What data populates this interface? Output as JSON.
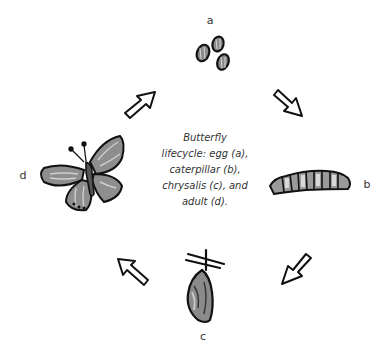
{
  "diagram": {
    "title": "Butterfly lifecycle",
    "caption_lines": [
      "Butterfly",
      "lifecycle: egg (a),",
      "caterpillar (b),",
      "chrysalis (c), and",
      "adult (d)."
    ],
    "stages": [
      {
        "id": "a",
        "label": "a",
        "name": "egg",
        "icon": "eggs-icon"
      },
      {
        "id": "b",
        "label": "b",
        "name": "caterpillar",
        "icon": "caterpillar-icon"
      },
      {
        "id": "c",
        "label": "c",
        "name": "chrysalis",
        "icon": "chrysalis-icon"
      },
      {
        "id": "d",
        "label": "d",
        "name": "adult",
        "icon": "butterfly-icon"
      }
    ],
    "arrows": [
      {
        "from": "a",
        "to": "b",
        "direction": "down-right"
      },
      {
        "from": "b",
        "to": "c",
        "direction": "down-left"
      },
      {
        "from": "c",
        "to": "d",
        "direction": "up-left"
      },
      {
        "from": "d",
        "to": "a",
        "direction": "up-right"
      }
    ],
    "colors": {
      "outline": "#111111",
      "fill_dark": "#6e6e6e",
      "fill_mid": "#9a9a9a",
      "fill_light": "#d0d0d0",
      "background": "#ffffff"
    }
  }
}
